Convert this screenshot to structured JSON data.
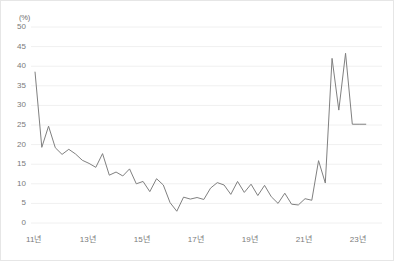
{
  "chart_data": {
    "type": "line",
    "title": "",
    "subtitle": "",
    "xlabel": "",
    "ylabel": "",
    "unit_label": "(%)",
    "ylim": [
      0,
      50
    ],
    "ytick_values": [
      0,
      5,
      10,
      15,
      20,
      25,
      30,
      35,
      40,
      45,
      50
    ],
    "ytick_labels": [
      "0",
      "5",
      "10",
      "15",
      "20",
      "25",
      "30",
      "35",
      "40",
      "45",
      "50"
    ],
    "xtick_labels": [
      "11년",
      "13년",
      "15년",
      "17년",
      "19년",
      "21년",
      "23년"
    ],
    "xtick_values": [
      2011,
      2013,
      2015,
      2017,
      2019,
      2021,
      2023
    ],
    "xlim": [
      2010.9,
      2023.9
    ],
    "grid": true,
    "grid_axis": "y",
    "legend": false,
    "legend_position": "none",
    "line_color": "#808080",
    "grid_color": "#f0f0f0",
    "border_color": "#e6e6e6",
    "tick_text_color": "#7a7a7a",
    "series": [
      {
        "name": "",
        "x": [
          2011.05,
          2011.3,
          2011.55,
          2011.8,
          2012.05,
          2012.3,
          2012.55,
          2012.8,
          2013.05,
          2013.3,
          2013.55,
          2013.8,
          2014.05,
          2014.3,
          2014.55,
          2014.8,
          2015.05,
          2015.3,
          2015.55,
          2015.8,
          2016.05,
          2016.3,
          2016.55,
          2016.8,
          2017.05,
          2017.3,
          2017.55,
          2017.8,
          2018.05,
          2018.3,
          2018.55,
          2018.8,
          2019.05,
          2019.3,
          2019.55,
          2019.8,
          2020.05,
          2020.3,
          2020.55,
          2020.8,
          2021.05,
          2021.3,
          2021.55,
          2021.8,
          2022.05,
          2022.3,
          2022.55,
          2022.8,
          2023.05,
          2023.3
        ],
        "y": [
          38.5,
          19.3,
          24.7,
          19.2,
          17.5,
          18.8,
          17.6,
          16.0,
          15.2,
          14.2,
          17.7,
          12.2,
          13.0,
          12.0,
          13.8,
          10.0,
          10.6,
          8.0,
          11.3,
          9.7,
          5.2,
          3.0,
          6.6,
          6.1,
          6.5,
          6.0,
          8.9,
          10.3,
          9.7,
          7.3,
          10.6,
          7.8,
          9.9,
          7.0,
          9.6,
          6.7,
          5.0,
          7.6,
          4.8,
          4.6,
          6.2,
          5.8,
          15.9,
          10.2,
          42.0,
          28.8,
          43.3,
          25.2,
          25.2,
          25.2
        ]
      }
    ]
  }
}
